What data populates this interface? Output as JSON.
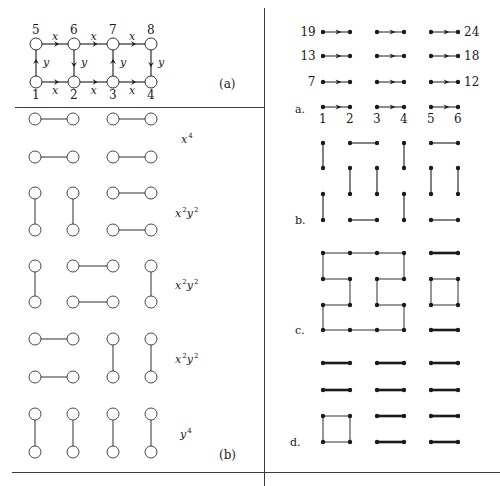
{
  "colors": {
    "ink": "#1a1a1a",
    "rule": "#3a3a3a",
    "node_fill": "#ffffff"
  },
  "panel_a": {
    "label": "(a)",
    "nodes": [
      {
        "id": "1",
        "x": 36,
        "y": 82,
        "label_pos": "below"
      },
      {
        "id": "2",
        "x": 74,
        "y": 82,
        "label_pos": "below"
      },
      {
        "id": "3",
        "x": 113,
        "y": 82,
        "label_pos": "below"
      },
      {
        "id": "4",
        "x": 151,
        "y": 82,
        "label_pos": "below"
      },
      {
        "id": "5",
        "x": 36,
        "y": 44,
        "label_pos": "above"
      },
      {
        "id": "6",
        "x": 74,
        "y": 44,
        "label_pos": "above"
      },
      {
        "id": "7",
        "x": 113,
        "y": 44,
        "label_pos": "above"
      },
      {
        "id": "8",
        "x": 151,
        "y": 44,
        "label_pos": "above"
      }
    ],
    "edges": [
      {
        "from": "5",
        "to": "6",
        "label": "x"
      },
      {
        "from": "6",
        "to": "7",
        "label": "x"
      },
      {
        "from": "7",
        "to": "8",
        "label": "x"
      },
      {
        "from": "1",
        "to": "2",
        "label": "x"
      },
      {
        "from": "2",
        "to": "3",
        "label": "x"
      },
      {
        "from": "3",
        "to": "4",
        "label": "x"
      },
      {
        "from": "1",
        "to": "5",
        "label": "y"
      },
      {
        "from": "6",
        "to": "2",
        "label": "y"
      },
      {
        "from": "3",
        "to": "7",
        "label": "y"
      },
      {
        "from": "8",
        "to": "4",
        "label": "y"
      }
    ]
  },
  "panel_b": {
    "label": "(b)",
    "columns_x": [
      35,
      73,
      113,
      151
    ],
    "groups": [
      {
        "term_base": "x",
        "term_exp": "4",
        "term_base2": "",
        "term_exp2": "",
        "rows_y": [
          119,
          157
        ],
        "pairs": [
          [
            "h",
            0,
            1,
            0
          ],
          [
            "h",
            2,
            3,
            0
          ],
          [
            "h",
            0,
            1,
            1
          ],
          [
            "h",
            2,
            3,
            1
          ]
        ]
      },
      {
        "term_base": "x",
        "term_exp": "2",
        "term_base2": "y",
        "term_exp2": "2",
        "rows_y": [
          193,
          230
        ],
        "pairs": [
          [
            "v",
            0
          ],
          [
            "v",
            1
          ],
          [
            "h",
            2,
            3,
            0
          ],
          [
            "h",
            2,
            3,
            1
          ]
        ]
      },
      {
        "term_base": "x",
        "term_exp": "2",
        "term_base2": "y",
        "term_exp2": "2",
        "rows_y": [
          266,
          302
        ],
        "pairs": [
          [
            "v",
            0
          ],
          [
            "h",
            1,
            2,
            0
          ],
          [
            "h",
            1,
            2,
            1
          ],
          [
            "v",
            3
          ]
        ]
      },
      {
        "term_base": "x",
        "term_exp": "2",
        "term_base2": "y",
        "term_exp2": "2",
        "rows_y": [
          339,
          377
        ],
        "pairs": [
          [
            "h",
            0,
            1,
            0
          ],
          [
            "h",
            0,
            1,
            1
          ],
          [
            "v",
            2
          ],
          [
            "v",
            3
          ]
        ]
      },
      {
        "term_base": "",
        "term_exp": "",
        "term_base2": "y",
        "term_exp2": "4",
        "rows_y": [
          414,
          452
        ],
        "pairs": [
          [
            "v",
            0
          ],
          [
            "v",
            1
          ],
          [
            "v",
            2
          ],
          [
            "v",
            3
          ]
        ]
      }
    ]
  },
  "right_panel": {
    "columns_x": [
      323,
      350,
      377,
      404,
      431,
      458
    ],
    "section_a": {
      "label": "a.",
      "rows_y": [
        32,
        56,
        82,
        107
      ],
      "left_row_labels": [
        "19",
        "13",
        "7",
        ""
      ],
      "right_row_labels": [
        "24",
        "18",
        "12",
        ""
      ],
      "column_numbers": [
        "1",
        "2",
        "3",
        "4",
        "5",
        "6"
      ]
    },
    "section_b": {
      "label": "b.",
      "rows_y": [
        143,
        168,
        194,
        220
      ],
      "edges": [
        [
          0,
          0,
          0,
          1
        ],
        [
          1,
          0,
          2,
          0
        ],
        [
          3,
          0,
          3,
          1
        ],
        [
          4,
          0,
          5,
          0
        ],
        [
          1,
          1,
          1,
          2
        ],
        [
          2,
          1,
          2,
          2
        ],
        [
          4,
          1,
          4,
          2
        ],
        [
          5,
          1,
          5,
          2
        ],
        [
          0,
          2,
          0,
          3
        ],
        [
          3,
          2,
          3,
          3
        ],
        [
          1,
          3,
          2,
          3
        ],
        [
          4,
          3,
          5,
          3
        ]
      ]
    },
    "section_c": {
      "label": "c.",
      "rows_y": [
        253,
        279,
        305,
        330
      ],
      "thin_edges": [
        [
          0,
          0,
          1,
          0
        ],
        [
          1,
          0,
          2,
          0
        ],
        [
          2,
          0,
          3,
          0
        ],
        [
          0,
          0,
          0,
          1
        ],
        [
          0,
          1,
          1,
          1
        ],
        [
          1,
          1,
          1,
          2
        ],
        [
          1,
          2,
          0,
          2
        ],
        [
          0,
          2,
          0,
          3
        ],
        [
          0,
          3,
          1,
          3
        ],
        [
          1,
          3,
          2,
          3
        ],
        [
          2,
          3,
          3,
          3
        ],
        [
          3,
          0,
          3,
          1
        ],
        [
          3,
          1,
          2,
          1
        ],
        [
          2,
          1,
          2,
          2
        ],
        [
          2,
          2,
          3,
          2
        ],
        [
          3,
          2,
          3,
          3
        ],
        [
          4,
          1,
          5,
          1
        ],
        [
          5,
          1,
          5,
          2
        ],
        [
          5,
          2,
          4,
          2
        ],
        [
          4,
          2,
          4,
          1
        ]
      ],
      "thick_edges": [
        [
          4,
          0,
          5,
          0
        ],
        [
          4,
          3,
          5,
          3
        ]
      ]
    },
    "section_d": {
      "label": "d.",
      "rows_y": [
        363,
        390,
        416,
        442
      ],
      "thin_edges": [
        [
          0,
          2,
          1,
          2
        ],
        [
          1,
          2,
          1,
          3
        ],
        [
          1,
          3,
          0,
          3
        ],
        [
          0,
          3,
          0,
          2
        ]
      ],
      "thick_edges": [
        [
          0,
          0,
          1,
          0
        ],
        [
          2,
          0,
          3,
          0
        ],
        [
          4,
          0,
          5,
          0
        ],
        [
          0,
          1,
          1,
          1
        ],
        [
          2,
          1,
          3,
          1
        ],
        [
          4,
          1,
          5,
          1
        ],
        [
          2,
          2,
          3,
          2
        ],
        [
          4,
          2,
          5,
          2
        ],
        [
          2,
          3,
          3,
          3
        ],
        [
          4,
          3,
          5,
          3
        ]
      ]
    }
  }
}
